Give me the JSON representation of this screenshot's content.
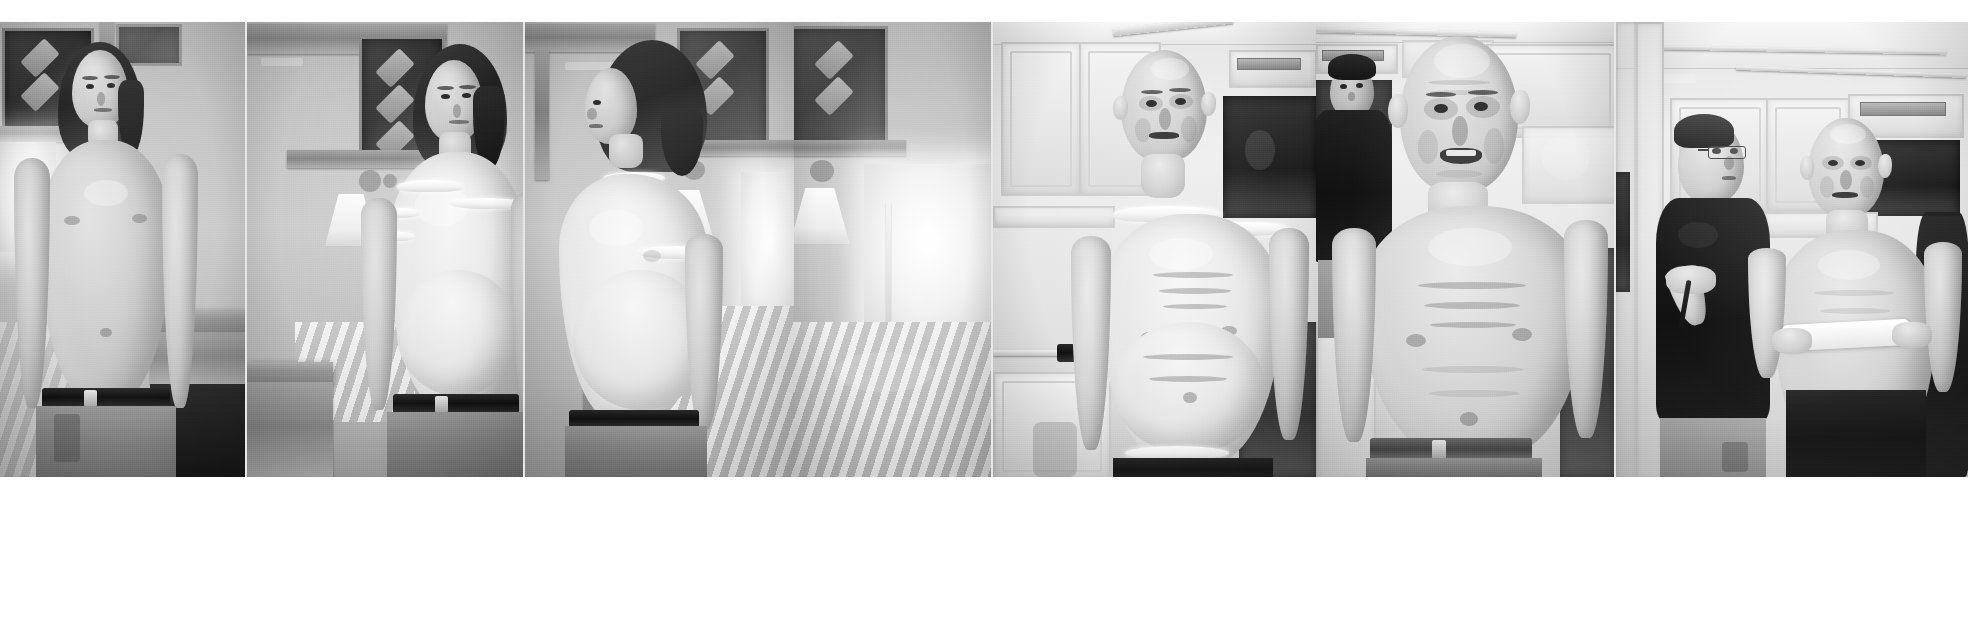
{
  "page": {
    "kind": "photographic-contact-strip",
    "tone": "black-and-white",
    "panel_count": 7,
    "background_color": "#ffffff",
    "strip_background": "#c9c9c7",
    "image_area": {
      "x": 0,
      "y": 22,
      "width": 1968,
      "height": 455
    },
    "margins": {
      "top": 22,
      "bottom": 152
    }
  },
  "strip": {
    "panels": [
      {
        "index": 1,
        "name": "panel-1-actor-bare-torso-front",
        "stage": "before",
        "setting": "trailer-interior",
        "subject": "young-actor",
        "description": "Young shirtless actor with shoulder-length dark hair, bare slim torso, facing camera, standing in a production trailer with leaded-glass wood cabinets behind",
        "wardrobe": "cargo-pants-with-black-belt",
        "makeup": "none",
        "width": 246
      },
      {
        "index": 2,
        "name": "panel-2-chest-appliance-applied",
        "stage": "step-1",
        "setting": "trailer-interior",
        "subject": "young-actor",
        "description": "Same actor now wearing a pale foam-latex chest and belly appliance with visible ragged seam edges at shoulders and neckline; lamp and bed visible behind",
        "wardrobe": "cargo-pants-with-black-belt",
        "makeup": "body-prosthetic-unpainted",
        "width": 277
      },
      {
        "index": 3,
        "name": "panel-3-appliance-profile-view",
        "stage": "step-2",
        "setting": "trailer-interior",
        "subject": "young-actor",
        "description": "Three-quarter back/profile view of the actor showing the pale body suit seam across the upper arm and the padded belly silhouette; wall lamp and bedspread behind",
        "wardrobe": "cargo-pants-with-black-belt",
        "makeup": "body-prosthetic-unpainted",
        "width": 270
      },
      {
        "index": 4,
        "name": "panel-4-trailer-window-gap",
        "stage": "step-2",
        "setting": "trailer-interior",
        "subject": "set-background",
        "description": "Bright trailer window, lamp and bedspread filling the narrow frame between poses",
        "wardrobe": "",
        "makeup": "",
        "width": 198
      },
      {
        "index": 5,
        "name": "panel-5-full-old-age-makeup-kitchen",
        "stage": "step-3",
        "setting": "white-kitchen",
        "subject": "aged-character",
        "description": "Actor now in complete old-age makeup: bald cap, gaunt sunken face, deep-set eyes, wrinkled pale torso appliance with exposed seam at the left shoulder; dark shorts; white kitchen cabinets and a dark recess behind",
        "wardrobe": "dark-shorts",
        "makeup": "full-old-age-prosthetic-unblended",
        "width": 324
      },
      {
        "index": 6,
        "name": "panel-6-finished-character-closer",
        "stage": "finished",
        "setting": "white-kitchen",
        "subject": "aged-character",
        "description": "Closer view of the finished elderly character — bald head, heavily wrinkled face with open mouth, sagging painted torso and belly, grey belt and trousers; a crew member in a black shirt stands in the background",
        "wardrobe": "trousers-with-grey-belt",
        "makeup": "full-old-age-prosthetic-painted",
        "width": 300
      },
      {
        "index": 7,
        "name": "panel-7-makeup-artist-final-touches",
        "stage": "finished",
        "setting": "white-kitchen",
        "subject": "aged-character-and-makeup-artist",
        "description": "Makeup artist in glasses and dark t-shirt holding a brush and a white cloth, applying final touches to the fully transformed elderly character who stands in dark shorts beside white cabinets and a window",
        "wardrobe": "dark-shorts",
        "makeup": "full-old-age-prosthetic-painted",
        "width": 353
      }
    ]
  },
  "palette": {
    "paper_white": "#ffffff",
    "strip_grey": "#c9c9c7",
    "highlight": "#f6f4ee",
    "midtone": "#b5b0a7",
    "shadow": "#2a2826",
    "deep_black": "#141312"
  }
}
